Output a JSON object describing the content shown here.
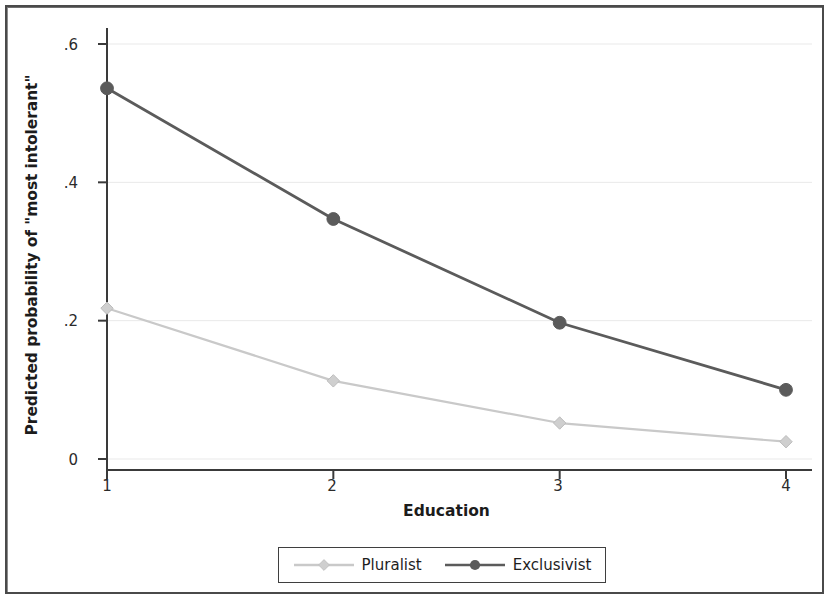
{
  "chart_data": {
    "type": "line",
    "title": "",
    "subtitle": "",
    "xlabel": "Education",
    "ylabel": "Predicted probability of \"most intolerant\"",
    "x": [
      1,
      2,
      3,
      4
    ],
    "categories": [
      "1",
      "2",
      "3",
      "4"
    ],
    "xtick_labels": [
      "1",
      "2",
      "3",
      "4"
    ],
    "ytick_labels": [
      "0",
      ".2",
      ".4",
      ".6"
    ],
    "ytick_values": [
      0,
      0.2,
      0.4,
      0.6
    ],
    "xlim": [
      0.87,
      4.13
    ],
    "ylim": [
      0,
      0.6
    ],
    "grid": true,
    "grid_axis": "y",
    "grid_color": "#e9e9e9",
    "legend_position": "below-center",
    "series": [
      {
        "name": "Pluralist",
        "values": [
          0.218,
          0.113,
          0.052,
          0.025
        ],
        "color": "#c9c9c9",
        "marker": "diamond"
      },
      {
        "name": "Exclusivist",
        "values": [
          0.536,
          0.347,
          0.197,
          0.1
        ],
        "color": "#5b5b5b",
        "marker": "circle"
      }
    ]
  },
  "legend": {
    "items": [
      {
        "label": "Pluralist",
        "color": "#c9c9c9",
        "marker": "diamond"
      },
      {
        "label": "Exclusivist",
        "color": "#5b5b5b",
        "marker": "circle"
      }
    ]
  },
  "axes": {
    "axis_color": "#3a3a3a",
    "tick_label_color": "#2b2b2b"
  },
  "frame": {
    "border_color": "#4a4a4a"
  }
}
